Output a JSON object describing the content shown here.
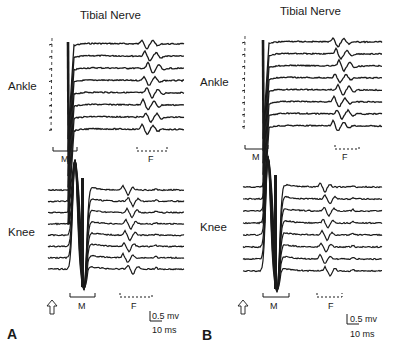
{
  "figure": {
    "panels": [
      {
        "letter": "A",
        "title": "Tibial Nerve",
        "rows": [
          {
            "site": "Ankle",
            "m_label": "M",
            "f_label": "F",
            "trace_count": 8
          },
          {
            "site": "Knee",
            "m_label": "M",
            "f_label": "F",
            "trace_count": 8
          }
        ],
        "stimulus_marker": "arrow-up",
        "scale": {
          "amplitude": "0.5 mv",
          "time": "10 ms"
        }
      },
      {
        "letter": "B",
        "title": "Tibial Nerve",
        "rows": [
          {
            "site": "Ankle",
            "m_label": "M",
            "f_label": "F",
            "trace_count": 8
          },
          {
            "site": "Knee",
            "m_label": "M",
            "f_label": "F",
            "trace_count": 8
          }
        ],
        "stimulus_marker": "arrow-up",
        "scale": {
          "amplitude": "0.5 mv",
          "time": "10 ms"
        }
      }
    ],
    "colors": {
      "trace": "#1a1a1a",
      "background": "#ffffff"
    }
  }
}
